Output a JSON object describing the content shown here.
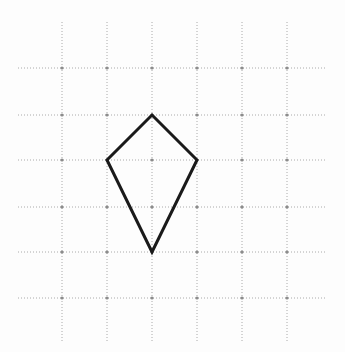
{
  "canvas": {
    "width": 345,
    "height": 352,
    "background_color": "#fdfdfd",
    "title": "Kite shape drawn on dotted coordinate grid"
  },
  "grid": {
    "style": "dotted",
    "line_color": "#aaaaaa",
    "node_color": "#8c8c8c",
    "stroke_width": 1,
    "dash_pattern": "1 2",
    "vertical_lines_x": [
      62,
      107,
      152,
      197,
      242,
      287
    ],
    "horizontal_lines_y": [
      68,
      115,
      160,
      207,
      252,
      298
    ],
    "vertical_extent_y": [
      22,
      342
    ],
    "horizontal_extent_x": [
      18,
      327
    ],
    "spacing_x": 45,
    "spacing_y": 46,
    "columns": 6,
    "rows": 6
  },
  "figure": {
    "name": "kite",
    "shape_type": "quadrilateral",
    "closed": true,
    "stroke_color": "#1a1a1a",
    "stroke_width": 3,
    "fill": "none",
    "vertices": [
      {
        "label": "top",
        "x": 152,
        "y": 115
      },
      {
        "label": "right",
        "x": 197,
        "y": 160
      },
      {
        "label": "bottom",
        "x": 152,
        "y": 252
      },
      {
        "label": "left",
        "x": 107,
        "y": 160
      }
    ],
    "path_d": "M 152 115 L 197 160 L 152 252 L 107 160 Z",
    "grid_vertices": [
      {
        "label": "top",
        "col": 2,
        "row": 1
      },
      {
        "label": "right",
        "col": 3,
        "row": 2
      },
      {
        "label": "bottom",
        "col": 2,
        "row": 4
      },
      {
        "label": "left",
        "col": 1,
        "row": 2
      }
    ]
  },
  "chart_data": {
    "type": "scatter",
    "title": "",
    "xlabel": "",
    "ylabel": "",
    "grid": true,
    "legend": null,
    "xlim": [
      0,
      345
    ],
    "ylim": [
      0,
      352
    ],
    "xticks": [
      62,
      107,
      152,
      197,
      242,
      287
    ],
    "yticks": [
      68,
      115,
      160,
      207,
      252,
      298
    ],
    "series": [
      {
        "name": "kite",
        "x": [
          152,
          197,
          152,
          107,
          152
        ],
        "y": [
          115,
          160,
          252,
          160,
          115
        ]
      }
    ]
  }
}
